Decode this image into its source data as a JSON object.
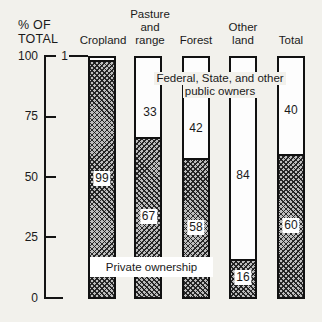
{
  "page": {
    "background": "#f2f1ec"
  },
  "axis": {
    "title": "% OF\nTOTAL"
  },
  "chart_data": {
    "type": "bar",
    "stacking": "percent",
    "title": "",
    "xlabel": "",
    "ylabel": "% OF TOTAL",
    "ylim": [
      0,
      100
    ],
    "yticks": [
      0,
      25,
      50,
      75,
      100
    ],
    "ytick_labels": [
      "100",
      "75",
      "50",
      "25",
      "0"
    ],
    "grid": false,
    "legend_position": "in-chart-annotations",
    "categories": [
      "Cropland",
      "Pasture and range",
      "Forest",
      "Other land",
      "Total"
    ],
    "category_display": [
      "Cropland",
      "Pasture\nand\nrange",
      "Forest",
      "Other\nland",
      "Total"
    ],
    "series": [
      {
        "name": "Private ownership",
        "style": "crosshatch",
        "values": [
          99,
          67,
          58,
          16,
          60
        ]
      },
      {
        "name": "Federal, State, and other public owners",
        "style": "white",
        "values": [
          1,
          33,
          42,
          84,
          40
        ]
      }
    ]
  },
  "annotations": {
    "public_line1": "Federal, State, and other",
    "public_line2": "public owners",
    "private_box": "Private ownership"
  },
  "colors": {
    "background": "#f2f1ec",
    "bar_outline": "#111111",
    "hatch_fill": "#bdbdbd",
    "hatch_line": "#1e1e1e",
    "text": "#1a1a1a",
    "bar_white": "#fdfdfd"
  }
}
